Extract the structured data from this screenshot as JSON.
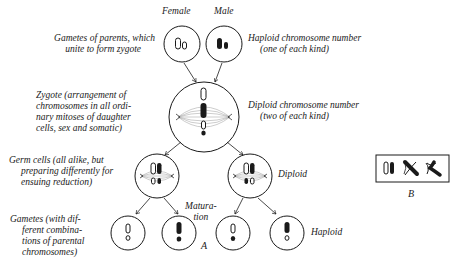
{
  "header": {
    "female_label": "Female",
    "male_label": "Male"
  },
  "left_labels": {
    "gametes_parents": [
      "Gametes of parents, which",
      "unite to form zygote"
    ],
    "zygote": [
      "Zygote (arrangement of",
      "chromosomes in all ordi-",
      "nary mitoses of daughter",
      "cells, sex and somatic)"
    ],
    "germ_cells": [
      "Germ cells (all alike, but",
      "preparing differently for",
      "ensuing reduction)"
    ],
    "gametes_combos": [
      "Gametes (with dif-",
      "ferent combina-",
      "tions of parental",
      "chromosomes)"
    ]
  },
  "right_labels": {
    "haploid_number": [
      "Haploid chromosome number",
      "(one of each kind)"
    ],
    "diploid_number": [
      "Diploid chromosome number",
      "(two of each kind)"
    ],
    "diploid": "Diploid",
    "haploid": "Haploid"
  },
  "middle_labels": {
    "maturation": [
      "Matura-",
      "tion"
    ],
    "figure_a": "A",
    "figure_b": "B"
  },
  "colors": {
    "ink": "#1a1a1a",
    "spindle": "#9a9a9a",
    "background": "#ffffff"
  }
}
